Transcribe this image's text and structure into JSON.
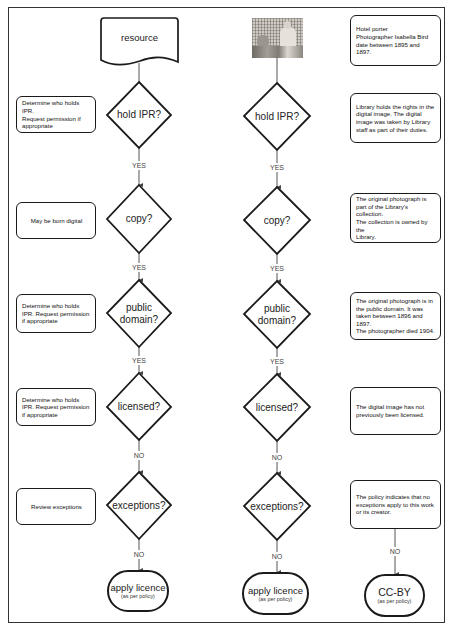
{
  "generic": {
    "start": {
      "label": "resource"
    },
    "decisions": [
      {
        "label": "hold IPR?"
      },
      {
        "label": "copy?"
      },
      {
        "label": "public domain?"
      },
      {
        "label": "licensed?"
      },
      {
        "label": "exceptions?"
      }
    ],
    "connectors": [
      "YES",
      "YES",
      "YES",
      "NO",
      "NO"
    ],
    "end": {
      "title": "apply licence",
      "subtitle": "(as per policy)"
    },
    "notes": [
      "Determine who holds IPR.\nRequest permission if\nappropriate",
      "May be born digital",
      "Determine who holds\nIPR. Request permission\nif appropriate",
      "Determine who holds\nIPR. Request permission\nif appropriate",
      "Review exceptions"
    ]
  },
  "example": {
    "start": {
      "icon": "photograph-thumbnail"
    },
    "decisions": [
      {
        "label": "hold IPR?"
      },
      {
        "label": "copy?"
      },
      {
        "label": "public domain?"
      },
      {
        "label": "licensed?"
      },
      {
        "label": "exceptions?"
      }
    ],
    "connectors": [
      "YES",
      "YES",
      "YES",
      "NO",
      "NO"
    ],
    "end": {
      "title": "apply licence",
      "subtitle": "(as per policy)"
    }
  },
  "outcome": {
    "notes": [
      "Hotel porter\nPhotographer Isabella Bird\ndate between 1895 and\n1897.",
      "Library holds the rights in the\ndigital image. The digital\nimage was taken by Library\nstaff as part of their duties.",
      "The original photograph is\npart of the Library's collection.\nThe collection is owned by the\nLibrary.",
      "The original photograph is in\nthe public domain. It was\ntaken between 1896 and 1897.\nThe photographer died 1904.",
      "The digital image has not\npreviously been licensed.",
      "The policy indicates that no\nexceptions apply to this work\nor its creator."
    ],
    "connector": "NO",
    "end": {
      "title": "CC-BY",
      "subtitle": "(as per policy)"
    }
  },
  "colors": {
    "stroke": "#1a1a1a",
    "connector": "#555555",
    "background": "#ffffff",
    "frame": "#333333"
  }
}
